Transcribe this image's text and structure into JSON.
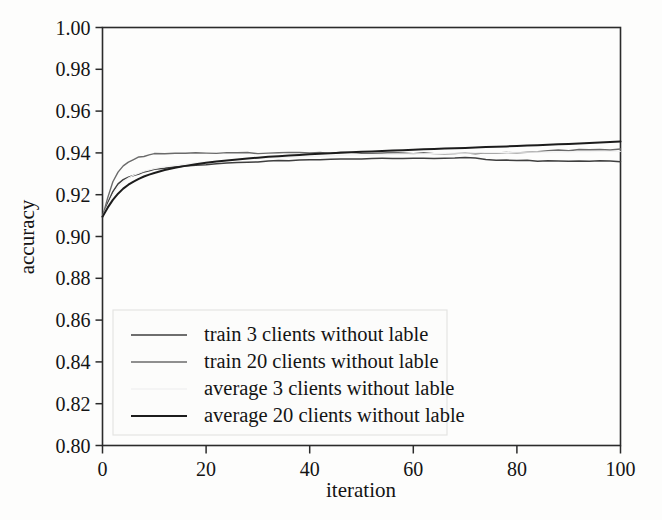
{
  "chart_data": {
    "type": "line",
    "title": "",
    "xlabel": "iteration",
    "ylabel": "accuracy",
    "xlim": [
      0,
      100
    ],
    "ylim": [
      0.8,
      1.0
    ],
    "grid": false,
    "legend_position": "lower left",
    "xticks": [
      "0",
      "20",
      "40",
      "60",
      "80",
      "100"
    ],
    "xtick_values": [
      0,
      20,
      40,
      60,
      80,
      100
    ],
    "yticks": [
      "0.80",
      "0.82",
      "0.84",
      "0.86",
      "0.88",
      "0.90",
      "0.92",
      "0.94",
      "0.96",
      "0.98",
      "1.00"
    ],
    "ytick_values": [
      0.8,
      0.82,
      0.84,
      0.86,
      0.88,
      0.9,
      0.92,
      0.94,
      0.96,
      0.98,
      1.0
    ],
    "x": [
      0,
      1,
      2,
      3,
      4,
      5,
      6,
      7,
      8,
      9,
      10,
      12,
      14,
      16,
      18,
      20,
      22,
      24,
      26,
      28,
      30,
      32,
      34,
      36,
      38,
      40,
      42,
      44,
      46,
      48,
      50,
      52,
      54,
      56,
      58,
      60,
      62,
      64,
      66,
      68,
      70,
      72,
      74,
      76,
      78,
      80,
      82,
      84,
      86,
      88,
      90,
      92,
      94,
      96,
      98,
      100
    ],
    "series": [
      {
        "name": "train 3 clients without lable",
        "color": "#3f3f3f",
        "width": 1.5,
        "noisy": true,
        "values": [
          0.9095,
          0.916,
          0.9215,
          0.9252,
          0.9272,
          0.9284,
          0.9292,
          0.93,
          0.9308,
          0.9315,
          0.932,
          0.9328,
          0.9332,
          0.9336,
          0.934,
          0.9345,
          0.9348,
          0.9352,
          0.9354,
          0.9356,
          0.9358,
          0.936,
          0.9362,
          0.9364,
          0.9366,
          0.9367,
          0.9368,
          0.9369,
          0.937,
          0.937,
          0.9371,
          0.9372,
          0.9372,
          0.9373,
          0.9373,
          0.9374,
          0.9374,
          0.9375,
          0.9375,
          0.9375,
          0.9376,
          0.9376,
          0.9368,
          0.9366,
          0.9365,
          0.9364,
          0.9364,
          0.9363,
          0.9363,
          0.9362,
          0.9362,
          0.9362,
          0.9361,
          0.9361,
          0.9361,
          0.936
        ]
      },
      {
        "name": "train 20 clients without lable",
        "color": "#6b6b6b",
        "width": 1.4,
        "noisy": true,
        "values": [
          0.9095,
          0.9185,
          0.9262,
          0.9308,
          0.9338,
          0.9356,
          0.9368,
          0.9378,
          0.9385,
          0.939,
          0.9394,
          0.9398,
          0.9398,
          0.9397,
          0.9399,
          0.94,
          0.9398,
          0.9399,
          0.94,
          0.9401,
          0.9399,
          0.9398,
          0.94,
          0.9402,
          0.94,
          0.9399,
          0.9401,
          0.9398,
          0.94,
          0.9402,
          0.9399,
          0.9397,
          0.94,
          0.9403,
          0.94,
          0.9398,
          0.9401,
          0.9398,
          0.9396,
          0.9399,
          0.9397,
          0.9395,
          0.9398,
          0.94,
          0.9402,
          0.9403,
          0.9405,
          0.9407,
          0.941,
          0.9412,
          0.9413,
          0.9414,
          0.9414,
          0.9415,
          0.9415,
          0.9416
        ]
      },
      {
        "name": "average 3 clients without lable",
        "color": "#f2f2f2",
        "width": 1.2,
        "noisy": false,
        "values": [
          0.9095,
          0.915,
          0.92,
          0.9238,
          0.9262,
          0.928,
          0.9293,
          0.9303,
          0.9312,
          0.9319,
          0.9325,
          0.9334,
          0.9341,
          0.9347,
          0.9352,
          0.9357,
          0.9361,
          0.9364,
          0.9367,
          0.937,
          0.9373,
          0.9375,
          0.9377,
          0.9379,
          0.9381,
          0.9383,
          0.9385,
          0.9386,
          0.9388,
          0.9389,
          0.939,
          0.9391,
          0.9392,
          0.9393,
          0.9394,
          0.9395,
          0.9396,
          0.9397,
          0.9398,
          0.9399,
          0.9399,
          0.94,
          0.9401,
          0.9401,
          0.9402,
          0.9403,
          0.9403,
          0.9404,
          0.9404,
          0.9405,
          0.9405,
          0.9406,
          0.9406,
          0.9407,
          0.9407,
          0.9408
        ]
      },
      {
        "name": "average 20 clients without lable",
        "color": "#1c1c1c",
        "width": 2.0,
        "noisy": false,
        "values": [
          0.9095,
          0.9138,
          0.9175,
          0.9205,
          0.9229,
          0.9248,
          0.9263,
          0.9276,
          0.9287,
          0.9296,
          0.9304,
          0.9318,
          0.9329,
          0.9338,
          0.9346,
          0.9353,
          0.9359,
          0.9364,
          0.9369,
          0.9373,
          0.9377,
          0.9381,
          0.9384,
          0.9387,
          0.939,
          0.9393,
          0.9396,
          0.9398,
          0.9401,
          0.9403,
          0.9405,
          0.9407,
          0.9409,
          0.9411,
          0.9413,
          0.9415,
          0.9417,
          0.9419,
          0.9421,
          0.9422,
          0.9424,
          0.9426,
          0.9428,
          0.9429,
          0.9431,
          0.9433,
          0.9435,
          0.9437,
          0.9439,
          0.9441,
          0.9443,
          0.9445,
          0.9447,
          0.945,
          0.9452,
          0.9455
        ]
      }
    ]
  },
  "legend": {
    "items": [
      {
        "label": "train 3 clients without lable"
      },
      {
        "label": "train 20 clients without lable"
      },
      {
        "label": "average 3 clients without lable"
      },
      {
        "label": "average 20 clients without lable"
      }
    ]
  }
}
